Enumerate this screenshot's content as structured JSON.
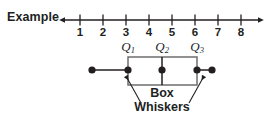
{
  "figure": {
    "caption_label": "Example",
    "colors": {
      "ink": "#221f1f",
      "box_stroke": "#6d6e71",
      "line": "#231f20",
      "background": "#ffffff"
    },
    "number_line": {
      "axis_y": 20,
      "start_x": 58,
      "end_x": 265,
      "left_arrow": true,
      "right_arrow": true,
      "tick_labels": [
        "1",
        "2",
        "3",
        "4",
        "5",
        "6",
        "7",
        "8"
      ],
      "tick_x": [
        80,
        103,
        126,
        149,
        172,
        195,
        218,
        241
      ],
      "tick_label_y": 24
    },
    "quartile_labels": [
      {
        "text": "Q",
        "sub": "1",
        "x": 128,
        "y": 36
      },
      {
        "text": "Q",
        "sub": "2",
        "x": 162,
        "y": 36
      },
      {
        "text": "Q",
        "sub": "3",
        "x": 197,
        "y": 36
      }
    ],
    "boxplot": {
      "whisker_y": 70,
      "box_top": 57,
      "box_bottom": 85,
      "box_left_x": 128,
      "box_right_x": 197,
      "median_x": 162,
      "min_x": 92,
      "max_x": 212,
      "dot_radius": 3.6,
      "dots_x": [
        92,
        128,
        162,
        197,
        212
      ]
    },
    "callouts": [
      {
        "name": "box",
        "text": "Box",
        "x": 162,
        "y": 88
      },
      {
        "name": "whiskers",
        "text": "Whiskers",
        "x": 162,
        "y": 101
      }
    ]
  }
}
